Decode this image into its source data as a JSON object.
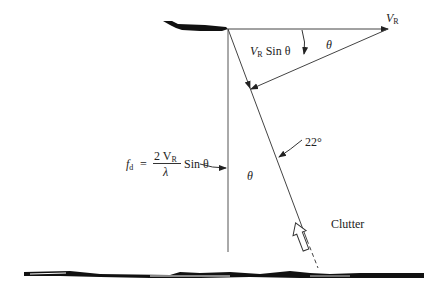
{
  "diagram": {
    "labels": {
      "velocity": "V",
      "velocity_sub": "R",
      "angle_top": "θ",
      "component_v": "V",
      "component_sub": "R",
      "component_rest": " Sin θ",
      "angle_mid": "θ",
      "depression_angle": "22°",
      "clutter": "Clutter",
      "formula_f": "f",
      "formula_f_sub": "d",
      "formula_eq": " = ",
      "formula_num": "2 V",
      "formula_num_sub": "R",
      "formula_den": "λ",
      "formula_tail": " Sin θ"
    },
    "elements": [
      "aircraft",
      "velocity-vector",
      "line-of-sight",
      "vertical-reference",
      "perpendicular-component",
      "ground-surface",
      "clutter-arrow"
    ]
  }
}
